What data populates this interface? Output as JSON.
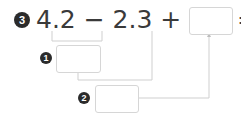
{
  "problem": {
    "number": "3",
    "expression": "4.2 − 2.3 + 3.8 =",
    "answer_value": ""
  },
  "steps": [
    {
      "number": "1",
      "value": ""
    },
    {
      "number": "2",
      "value": ""
    }
  ],
  "colors": {
    "badge": "#2b2b2b",
    "text": "#3a3a3a",
    "lines": "#cfcfcf"
  }
}
